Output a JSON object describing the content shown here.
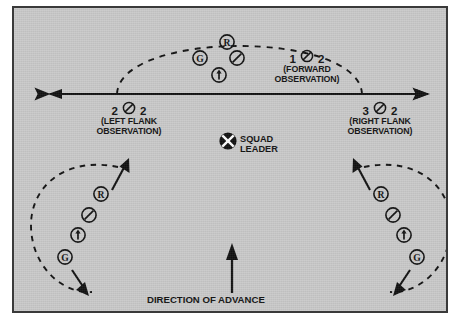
{
  "diagram": {
    "background_color": "#c9c9c9",
    "ink_color": "#111111",
    "frame_color": "#3a3a3a"
  },
  "labels": {
    "forward": {
      "left_num": "1",
      "right_num": "2",
      "symbol": "fire-team-slash",
      "caption_line1": "(FORWARD",
      "caption_line2": "OBSERVATION)"
    },
    "left_flank": {
      "left_num": "2",
      "right_num": "2",
      "symbol": "fire-team-slash",
      "caption_line1": "(LEFT FLANK",
      "caption_line2": "OBSERVATION)"
    },
    "right_flank": {
      "left_num": "3",
      "right_num": "2",
      "symbol": "fire-team-slash",
      "caption_line1": "(RIGHT FLANK",
      "caption_line2": "OBSERVATION)"
    },
    "squad_leader": {
      "line1": "SQUAD",
      "line2": "LEADER",
      "symbol": "squad-leader-x-circle"
    },
    "direction_of_advance": "DIRECTION OF ADVANCE"
  },
  "symbols": {
    "rifleman": "R",
    "grenadier": "G",
    "automatic_rifleman": "slash",
    "team_leader": "up-arrow"
  },
  "groups": [
    {
      "name": "forward-element",
      "members": [
        {
          "type": "rifleman",
          "glyph": "R",
          "x": 213,
          "y": 34
        },
        {
          "type": "grenadier",
          "glyph": "G",
          "x": 186,
          "y": 50
        },
        {
          "type": "automatic-rifleman",
          "glyph": "slash",
          "x": 223,
          "y": 50
        },
        {
          "type": "team-leader",
          "glyph": "arrow",
          "x": 205,
          "y": 67
        }
      ]
    },
    {
      "name": "left-flank-element",
      "members": [
        {
          "type": "rifleman",
          "glyph": "R",
          "x": 87,
          "y": 186
        },
        {
          "type": "automatic-rifleman",
          "glyph": "slash",
          "x": 75,
          "y": 207
        },
        {
          "type": "team-leader",
          "glyph": "arrow",
          "x": 64,
          "y": 227
        },
        {
          "type": "grenadier",
          "glyph": "G",
          "x": 51,
          "y": 249
        }
      ]
    },
    {
      "name": "right-flank-element",
      "members": [
        {
          "type": "rifleman",
          "glyph": "R",
          "x": 367,
          "y": 186
        },
        {
          "type": "automatic-rifleman",
          "glyph": "slash",
          "x": 379,
          "y": 207
        },
        {
          "type": "team-leader",
          "glyph": "arrow",
          "x": 390,
          "y": 227
        },
        {
          "type": "grenadier",
          "glyph": "G",
          "x": 403,
          "y": 249
        }
      ]
    }
  ]
}
